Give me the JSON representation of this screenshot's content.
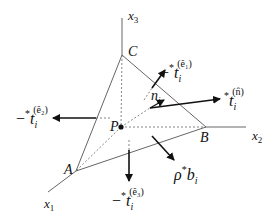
{
  "diagram": {
    "colors": {
      "line": "#555555",
      "arrow": "#111111",
      "text": "#111111"
    },
    "axes": [
      {
        "id": "x1",
        "label": "x",
        "sub": "1"
      },
      {
        "id": "x2",
        "label": "x",
        "sub": "2"
      },
      {
        "id": "x3",
        "label": "x",
        "sub": "3"
      }
    ],
    "vertices": {
      "A": "A",
      "B": "B",
      "C": "C",
      "P": "P"
    },
    "vectors": {
      "t_e1": {
        "minus": "−",
        "star": "*",
        "base": "t",
        "sub": "i",
        "sup": "(ê₁)"
      },
      "t_e2": {
        "minus": "−",
        "star": "*",
        "base": "t",
        "sub": "i",
        "sup": "(ê₂)"
      },
      "t_e3": {
        "minus": "−",
        "star": "*",
        "base": "t",
        "sub": "i",
        "sup": "(ê₃)"
      },
      "t_n": {
        "star": "*",
        "base": "t",
        "sub": "i",
        "sup": "(n̂)"
      },
      "normal": {
        "base": "n",
        "sub": "i"
      },
      "body_force": {
        "rho": "ρ",
        "star": "*",
        "base": "b",
        "sub": "i"
      }
    }
  }
}
